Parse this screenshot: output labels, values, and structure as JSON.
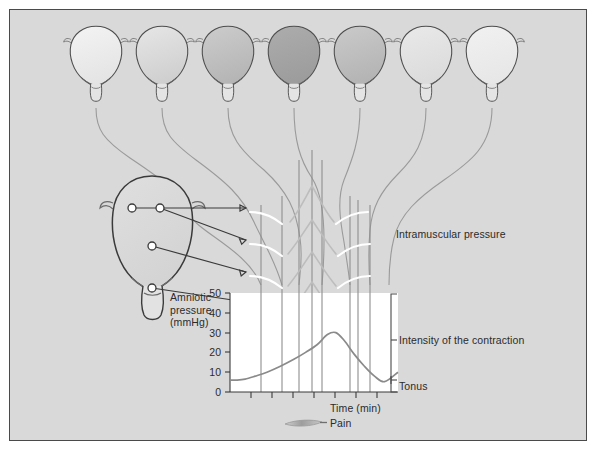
{
  "figure": {
    "background_color": "#d9d9d9",
    "border_color": "#4a4a4a"
  },
  "labels": {
    "intramuscular_pressure": "Intramuscular pressure",
    "intensity_of_contraction": "Intensity of the contraction",
    "tonus": "Tonus",
    "time_axis": "Time (min)",
    "pain": "Pain",
    "amniotic_pressure_line1": "Amniotic",
    "amniotic_pressure_line2": "pressure",
    "amniotic_pressure_line3": "(mmHg)"
  },
  "chart_data": {
    "type": "line",
    "xlabel": "Time (min)",
    "ylabel": "Amniotic pressure (mmHg)",
    "ylim": [
      0,
      50
    ],
    "ytick_labels": [
      "0",
      "10",
      "20",
      "30",
      "40",
      "50"
    ],
    "ytick_values": [
      0,
      10,
      20,
      30,
      40,
      50
    ],
    "xtick_count": 8,
    "grid": false,
    "series": [
      {
        "name": "Amniotic pressure",
        "color": "#8a8a8a",
        "x": [
          0,
          4,
          9,
          15,
          22,
          30,
          38,
          45,
          52,
          58,
          63,
          68,
          74,
          80,
          86,
          92,
          100
        ],
        "values": [
          6,
          6,
          6.5,
          8,
          10,
          13,
          16.5,
          20,
          24,
          29,
          30,
          26,
          19,
          13,
          8,
          5.2,
          10
        ]
      }
    ],
    "vertical_marker_positions_pct": [
      9,
      19,
      28,
      36,
      49,
      65,
      70,
      79
    ],
    "annotations": [
      {
        "name": "intensity-bracket",
        "label": "Intensity of the contraction",
        "from_value": 50,
        "to_value": 5
      },
      {
        "name": "tonus-bracket",
        "label": "Tonus",
        "at_value": 5
      },
      {
        "name": "pain-marker",
        "label": "Pain",
        "shape": "lens"
      }
    ]
  },
  "uterus_row": {
    "count": 7,
    "description": "Sequence of uterus outlines shading from light to dark and back, showing contraction intensity",
    "items": [
      {
        "index": 1,
        "shade_top": "#efefef",
        "shade_bottom": "#e2e2e2"
      },
      {
        "index": 2,
        "shade_top": "#e0e0e0",
        "shade_bottom": "#cfcfcf"
      },
      {
        "index": 3,
        "shade_top": "#c6c6c6",
        "shade_bottom": "#b6b6b6"
      },
      {
        "index": 4,
        "shade_top": "#a9a9a9",
        "shade_bottom": "#9d9d9d"
      },
      {
        "index": 5,
        "shade_top": "#c4c4c4",
        "shade_bottom": "#b4b4b4"
      },
      {
        "index": 6,
        "shade_top": "#e6e6e6",
        "shade_bottom": "#dcdcdc"
      },
      {
        "index": 7,
        "shade_top": "#efefef",
        "shade_bottom": "#e6e6e6"
      }
    ]
  },
  "electrode_uterus": {
    "description": "Large uterus cutaway at left with four intramuscular electrode sites",
    "electrodes": [
      {
        "index": 1,
        "name": "electrode-upper-left"
      },
      {
        "index": 2,
        "name": "electrode-upper-right"
      },
      {
        "index": 3,
        "name": "electrode-mid"
      },
      {
        "index": 4,
        "name": "electrode-lower"
      }
    ]
  },
  "intramuscular_traces": {
    "count": 4,
    "description": "Four white intramuscular pressure trace curves at the right of the electrode arrows"
  }
}
